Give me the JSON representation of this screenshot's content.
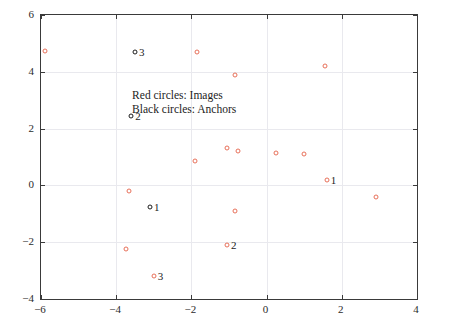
{
  "chart_data": {
    "type": "scatter",
    "title": "",
    "xlabel": "",
    "ylabel": "",
    "xlim": [
      -6,
      4
    ],
    "ylim": [
      -4,
      6
    ],
    "xticks": [
      -6,
      -4,
      -2,
      0,
      2,
      4
    ],
    "yticks": [
      -4,
      -2,
      0,
      2,
      4,
      6
    ],
    "xticklabels": [
      "−6",
      "−4",
      "−2",
      "0",
      "2",
      "4"
    ],
    "yticklabels": [
      "−4",
      "−2",
      "0",
      "2",
      "4",
      "6"
    ],
    "grid": true,
    "legend_position": "inside-upper-left",
    "annotations": [
      "Red circles: Images",
      "Black circles: Anchors"
    ],
    "series": [
      {
        "name": "Images",
        "marker": "circle-open",
        "color": "#e8705a",
        "points": [
          {
            "x": -5.9,
            "y": 4.75,
            "label": ""
          },
          {
            "x": -1.85,
            "y": 4.7,
            "label": ""
          },
          {
            "x": -0.85,
            "y": 3.9,
            "label": ""
          },
          {
            "x": 1.55,
            "y": 4.2,
            "label": ""
          },
          {
            "x": -1.9,
            "y": 0.85,
            "label": ""
          },
          {
            "x": -1.05,
            "y": 1.3,
            "label": ""
          },
          {
            "x": -0.75,
            "y": 1.2,
            "label": ""
          },
          {
            "x": 0.25,
            "y": 1.15,
            "label": ""
          },
          {
            "x": 1.0,
            "y": 1.1,
            "label": ""
          },
          {
            "x": -3.65,
            "y": -0.2,
            "label": ""
          },
          {
            "x": 1.6,
            "y": 0.2,
            "label": "1"
          },
          {
            "x": -0.85,
            "y": -0.9,
            "label": ""
          },
          {
            "x": 2.9,
            "y": -0.4,
            "label": ""
          },
          {
            "x": -3.75,
            "y": -2.25,
            "label": ""
          },
          {
            "x": -1.05,
            "y": -2.1,
            "label": "2"
          },
          {
            "x": -3.0,
            "y": -3.2,
            "label": "3"
          }
        ]
      },
      {
        "name": "Anchors",
        "marker": "circle-open",
        "color": "#1c1c1c",
        "points": [
          {
            "x": -3.5,
            "y": 4.7,
            "label": "3"
          },
          {
            "x": -3.6,
            "y": 2.45,
            "label": "2"
          },
          {
            "x": -3.1,
            "y": -0.75,
            "label": "1"
          }
        ]
      }
    ]
  }
}
